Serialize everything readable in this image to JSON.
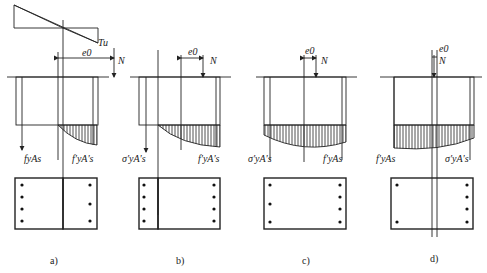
{
  "figure": {
    "panels": [
      {
        "id": "a",
        "caption": "a)",
        "strain_label": "Tu",
        "eccentricity_label": "e0",
        "force_label": "N",
        "left_force_label": "fyAs",
        "right_force_label": "f'yA's"
      },
      {
        "id": "b",
        "caption": "b)",
        "eccentricity_label": "e0",
        "force_label": "N",
        "left_force_label": "σ'yA's",
        "right_force_label": "f'yA's"
      },
      {
        "id": "c",
        "caption": "c)",
        "eccentricity_label": "e0",
        "force_label": "N",
        "left_force_label": "σ'yA's",
        "right_force_label": "f'yAs"
      },
      {
        "id": "d",
        "caption": "d)",
        "eccentricity_label": "e0",
        "force_label": "N",
        "left_force_label": "f'yAs",
        "right_force_label": "σ'yA's"
      }
    ]
  },
  "colors": {
    "line": "#222222",
    "background": "#ffffff"
  }
}
